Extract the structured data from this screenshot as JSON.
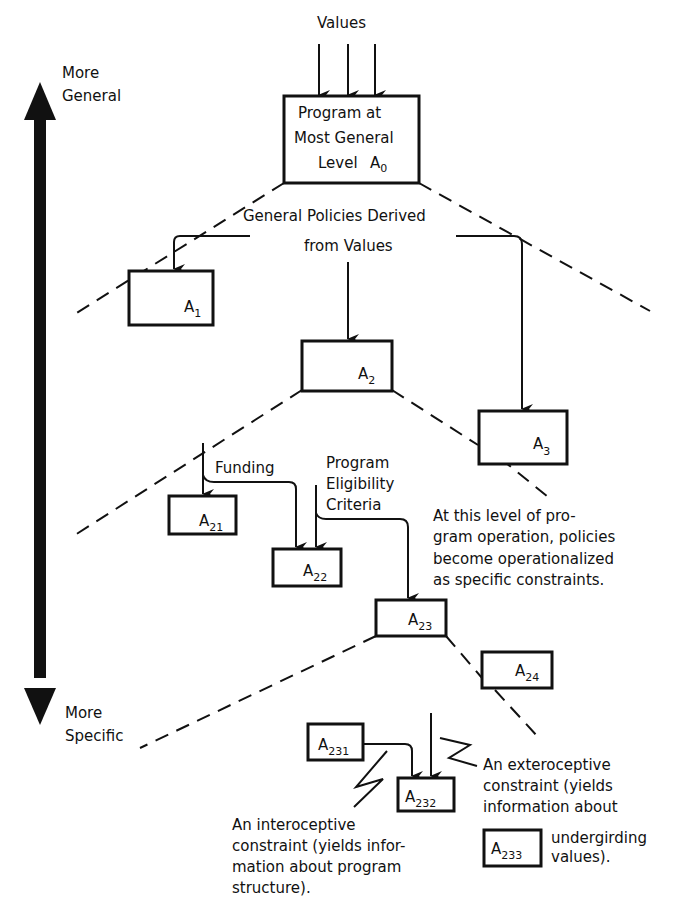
{
  "diagram": {
    "axis": {
      "top_label_line1": "More",
      "top_label_line2": "General",
      "bottom_label_line1": "More",
      "bottom_label_line2": "Specific"
    },
    "values_label": "Values",
    "root": {
      "line1": "Program at",
      "line2": "Most General",
      "line3": "Level",
      "id_main": "A",
      "id_sub": "0"
    },
    "policies_label_line1": "General Policies Derived",
    "policies_label_line2": "from Values",
    "nodes": {
      "a1": {
        "main": "A",
        "sub": "1"
      },
      "a2": {
        "main": "A",
        "sub": "2"
      },
      "a3": {
        "main": "A",
        "sub": "3"
      },
      "a21": {
        "main": "A",
        "sub": "21"
      },
      "a22": {
        "main": "A",
        "sub": "22"
      },
      "a23": {
        "main": "A",
        "sub": "23"
      },
      "a24": {
        "main": "A",
        "sub": "24"
      },
      "a231": {
        "main": "A",
        "sub": "231"
      },
      "a232": {
        "main": "A",
        "sub": "232"
      },
      "a233": {
        "main": "A",
        "sub": "233"
      }
    },
    "funding_label": "Funding",
    "eligibility_label_line1": "Program",
    "eligibility_label_line2": "Eligibility",
    "eligibility_label_line3": "Criteria",
    "operational_note": [
      "At this level of pro-",
      "gram operation, policies",
      "become operationalized",
      "as specific constraints."
    ],
    "interoceptive_note": [
      "An interoceptive",
      "constraint (yields infor-",
      "mation about program",
      "structure)."
    ],
    "exteroceptive_note": [
      "An exteroceptive",
      "constraint (yields",
      "information about",
      "undergirding",
      "values)."
    ]
  }
}
